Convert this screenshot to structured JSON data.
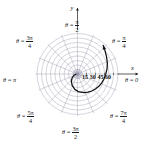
{
  "figure": {
    "kind": "polar-plot",
    "background_color": "#ffffff",
    "grid_color": "#8f8fa8",
    "curve_color": "#111111",
    "axis_color": "#1a1a1a",
    "center": {
      "x": 77.5,
      "y": 74.0
    },
    "outer_radius": 42.0
  },
  "axes": {
    "y_label": "y",
    "x_label": "x"
  },
  "angle_labels": [
    {
      "name": "theta-pi-over-2",
      "theta_text": "θ =",
      "numerator": "π",
      "denominator": "2",
      "radians": 1.5707963,
      "position": {
        "left": 65,
        "top": 19
      }
    },
    {
      "name": "theta-pi-over-4",
      "theta_text": "θ =",
      "numerator": "π",
      "denominator": "4",
      "radians": 0.7853982,
      "position": {
        "left": 112,
        "top": 35
      }
    },
    {
      "name": "theta-zero",
      "theta_text": "θ = 0",
      "numerator": "",
      "denominator": "",
      "radians": 0.0,
      "position": {
        "left": 125,
        "top": 77
      }
    },
    {
      "name": "theta-7pi-over-4",
      "theta_text": "θ =",
      "numerator": "7π",
      "denominator": "4",
      "radians": 5.4977871,
      "position": {
        "left": 110,
        "top": 110
      }
    },
    {
      "name": "theta-3pi-over-2",
      "theta_text": "θ =",
      "numerator": "3π",
      "denominator": "2",
      "radians": 4.712389,
      "position": {
        "left": 62,
        "top": 126
      }
    },
    {
      "name": "theta-5pi-over-4",
      "theta_text": "θ =",
      "numerator": "5π",
      "denominator": "4",
      "radians": 3.9269908,
      "position": {
        "left": 17,
        "top": 110
      }
    },
    {
      "name": "theta-pi",
      "theta_text": "θ = π",
      "numerator": "",
      "denominator": "",
      "radians": 3.1415927,
      "position": {
        "left": 3,
        "top": 77
      }
    },
    {
      "name": "theta-3pi-over-4",
      "theta_text": "θ =",
      "numerator": "3π",
      "denominator": "4",
      "radians": 2.3561945,
      "position": {
        "left": 16,
        "top": 35
      }
    }
  ],
  "chart_data": {
    "type": "line",
    "title": "",
    "xlabel": "x",
    "ylabel": "y",
    "coordinate_system": "polar",
    "grid": true,
    "legend": "none",
    "radial_ticks": {
      "values": [
        15,
        30,
        45,
        60
      ],
      "labels": [
        "15",
        "30",
        "45",
        "60"
      ],
      "axis_angle_radians": 0,
      "label_row_position": {
        "left": 82,
        "top": 74
      }
    },
    "radial_range": [
      0,
      70
    ],
    "angular_ticks_radians": [
      0.0,
      0.3926991,
      0.7853982,
      1.1780972,
      1.5707963,
      1.9634954,
      2.3561945,
      2.7488936,
      3.1415927,
      3.5342917,
      3.9269908,
      4.3196899,
      4.712389,
      5.1050881,
      5.4977871,
      5.8904862
    ],
    "grid_circles_radii": [
      7.5,
      15,
      22.5,
      30,
      37.5,
      45,
      52.5,
      60,
      67.5
    ],
    "series": [
      {
        "name": "spiral",
        "equation_hint": "r increases with θ (outward spiral, counter-clockwise)",
        "arrow_at_end": true,
        "theta_degrees": [
          190,
          200,
          215,
          230,
          245,
          260,
          275,
          290,
          300,
          310,
          320,
          330,
          340,
          350,
          360,
          370,
          380,
          390,
          400,
          408
        ],
        "r_values": [
          3,
          6,
          11,
          16,
          21,
          26,
          30,
          33,
          35,
          37,
          39,
          41,
          43,
          45,
          47,
          50,
          53,
          56,
          60,
          64
        ]
      }
    ]
  }
}
